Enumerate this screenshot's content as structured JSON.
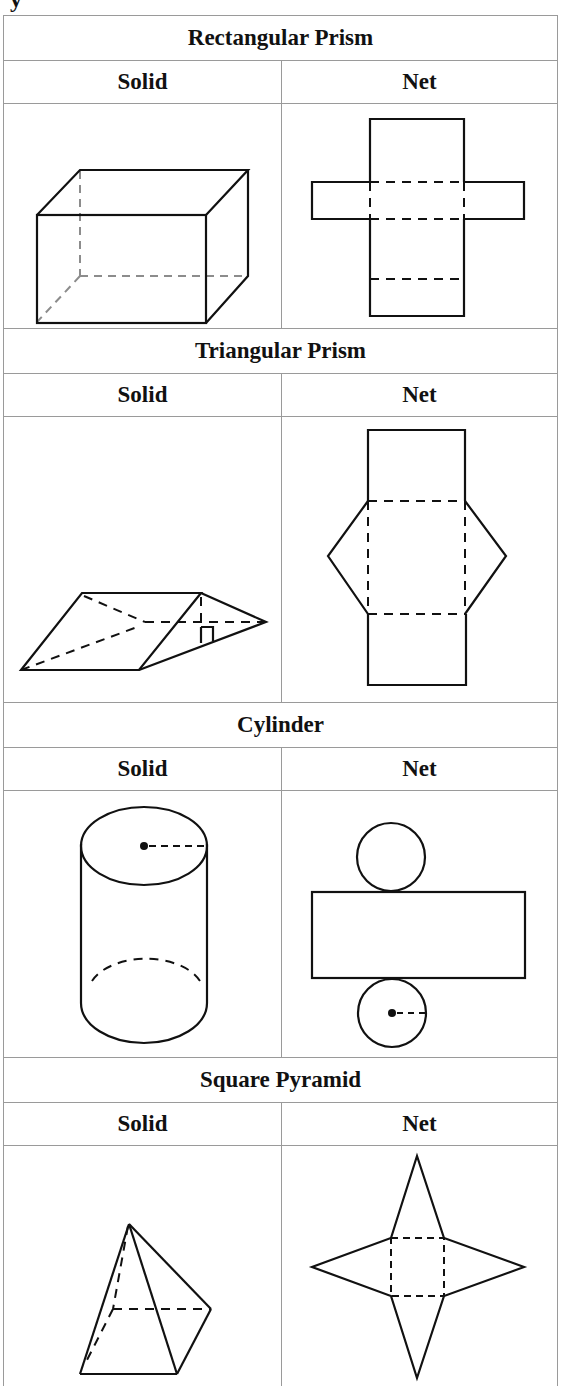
{
  "page": {
    "cutoff_text": "y"
  },
  "table": {
    "sections": [
      {
        "title": "Rectangular Prism",
        "headers": [
          "Solid",
          "Net"
        ],
        "solid_figure": "rectangular-prism-solid",
        "net_figure": "rectangular-prism-net"
      },
      {
        "title": "Triangular Prism",
        "headers": [
          "Solid",
          "Net"
        ],
        "solid_figure": "triangular-prism-solid",
        "net_figure": "triangular-prism-net"
      },
      {
        "title": "Cylinder",
        "headers": [
          "Solid",
          "Net"
        ],
        "solid_figure": "cylinder-solid",
        "net_figure": "cylinder-net"
      },
      {
        "title": "Square Pyramid",
        "headers": [
          "Solid",
          "Net"
        ],
        "solid_figure": "square-pyramid-solid",
        "net_figure": "square-pyramid-net"
      }
    ]
  },
  "colors": {
    "line": "#111111",
    "hidden_edge_gray": "#8c8c8c",
    "border": "#9a9a9a",
    "background": "#ffffff"
  }
}
